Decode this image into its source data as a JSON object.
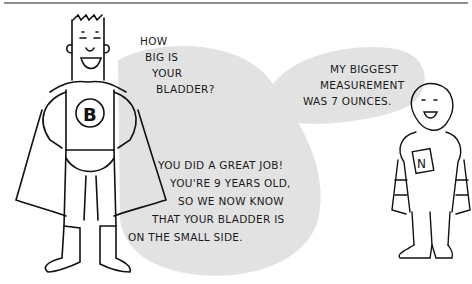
{
  "comic": {
    "top_rule_color": "#8f8f8f",
    "bubble_color": "#e2e2e2",
    "speaker_left": {
      "chest_letter": "B",
      "bubble_question": [
        "HOW",
        "BIG IS",
        "YOUR",
        "BLADDER?"
      ],
      "bubble_reply": [
        "YOU DID A GREAT JOB!",
        "YOU'RE 9 YEARS OLD,",
        "SO WE NOW KNOW",
        "THAT YOUR BLADDER IS",
        "ON THE SMALL SIDE."
      ]
    },
    "speaker_right": {
      "chest_letter": "N",
      "bubble_text": [
        "MY BIGGEST",
        "MEASUREMENT",
        "WAS 7 OUNCES."
      ]
    }
  }
}
